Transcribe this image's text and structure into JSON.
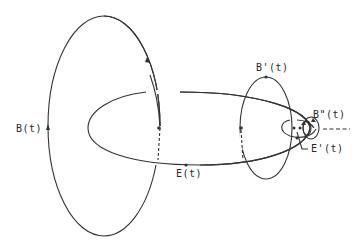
{
  "diagram": {
    "stroke_color": "#333333",
    "background": "#ffffff",
    "labels": {
      "B": "B(t)",
      "E": "E(t)",
      "Bprime": "B'(t)",
      "Bdouble": "B\"(t)",
      "Eprime": "E'(t)"
    },
    "curves": [
      {
        "name": "B(t)",
        "kind": "large vertical loop",
        "center": [
          104,
          126
        ],
        "rx": 56,
        "ry": 110
      },
      {
        "name": "E(t)",
        "kind": "horizontal loop linked with B(t) and B'(t)"
      },
      {
        "name": "B'(t)",
        "kind": "smaller vertical loop",
        "center": [
          266,
          128
        ],
        "rx": 26,
        "ry": 51
      },
      {
        "name": "E'(t)",
        "kind": "small horizontal loop"
      },
      {
        "name": "B\"(t)",
        "kind": "smallest loop"
      }
    ],
    "continuation": "dashed line to the right"
  }
}
